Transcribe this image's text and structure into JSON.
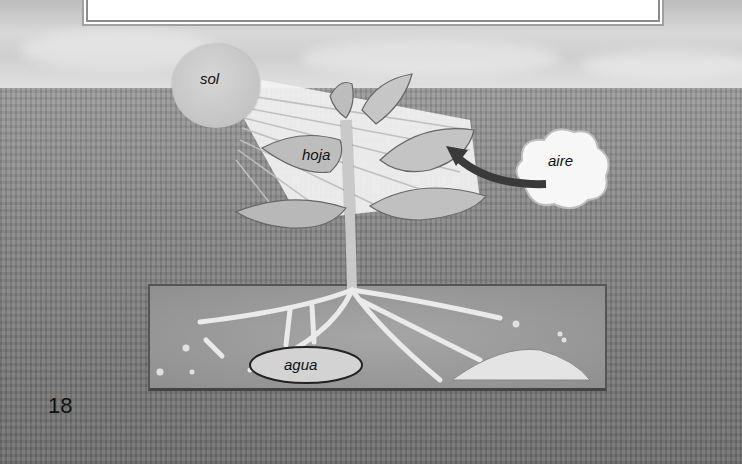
{
  "figure": {
    "labels": {
      "sun": "sol",
      "leaf": "hoja",
      "air": "aire",
      "water": "agua"
    },
    "page_number": "18"
  },
  "colors": {
    "sky": "#d0d0d0",
    "field": "#858585",
    "soil": "#9c9c9c",
    "arrow": "#3a3a3a",
    "text": "#111111"
  }
}
